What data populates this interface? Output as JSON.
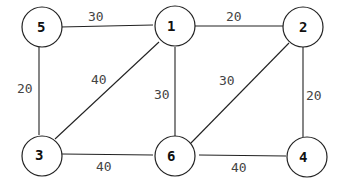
{
  "graph": {
    "nodes": [
      {
        "id": "5",
        "x": 40,
        "y": 27
      },
      {
        "id": "1",
        "x": 173,
        "y": 27
      },
      {
        "id": "2",
        "x": 303,
        "y": 27
      },
      {
        "id": "3",
        "x": 42,
        "y": 155
      },
      {
        "id": "6",
        "x": 173,
        "y": 155
      },
      {
        "id": "4",
        "x": 306,
        "y": 156
      }
    ],
    "edges": [
      {
        "from": "5",
        "to": "1",
        "weight": "30"
      },
      {
        "from": "1",
        "to": "2",
        "weight": "20"
      },
      {
        "from": "5",
        "to": "3",
        "weight": "20"
      },
      {
        "from": "1",
        "to": "3",
        "weight": "40"
      },
      {
        "from": "1",
        "to": "6",
        "weight": "30"
      },
      {
        "from": "2",
        "to": "6",
        "weight": "30"
      },
      {
        "from": "2",
        "to": "4",
        "weight": "20"
      },
      {
        "from": "3",
        "to": "6",
        "weight": "40"
      },
      {
        "from": "6",
        "to": "4",
        "weight": "40"
      }
    ]
  }
}
